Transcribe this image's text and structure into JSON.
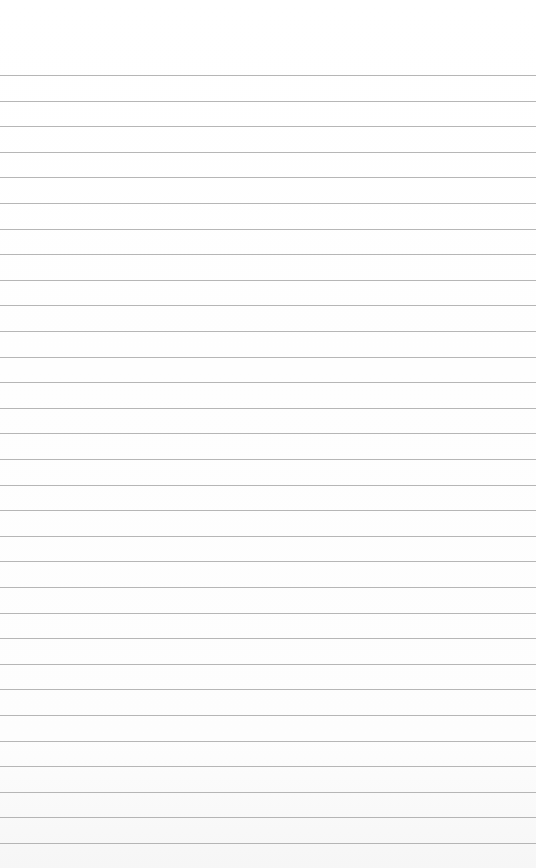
{
  "paper": {
    "type": "lined-paper",
    "background_color": "#ffffff",
    "line_color": "#a9a9a9",
    "first_line_y": 75,
    "line_spacing": 25.6,
    "line_count": 31,
    "text": ""
  }
}
